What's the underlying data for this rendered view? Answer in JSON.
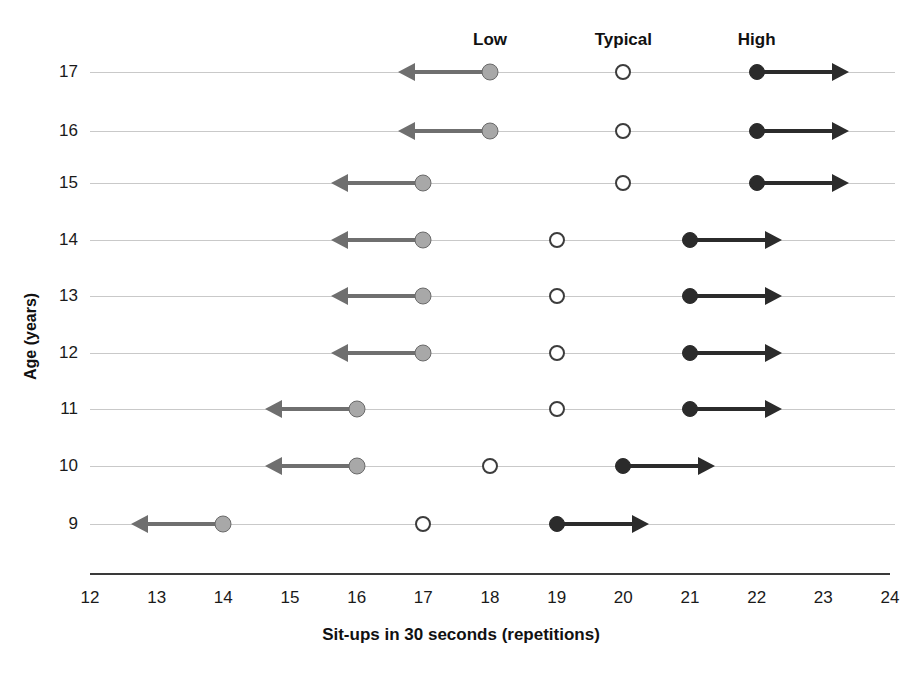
{
  "chart_data": {
    "type": "scatter",
    "title": "",
    "xlabel": "Sit-ups in 30 seconds (repetitions)",
    "ylabel": "Age (years)",
    "xlim": [
      12,
      24
    ],
    "ylim": [
      9,
      17
    ],
    "xticks": [
      "12",
      "13",
      "14",
      "15",
      "16",
      "17",
      "18",
      "19",
      "20",
      "21",
      "22",
      "23",
      "24"
    ],
    "yticks": [
      "9",
      "10",
      "11",
      "12",
      "13",
      "14",
      "15",
      "16",
      "17"
    ],
    "grid": true,
    "legend_position": "top",
    "band_labels": [
      {
        "text": "Low",
        "at_x": 18
      },
      {
        "text": "Typical",
        "at_x": 20
      },
      {
        "text": "High",
        "at_x": 22
      }
    ],
    "series": [
      {
        "name": "Low",
        "marker": "filled-gray-circle",
        "color": "#a8a8a8",
        "direction": "left"
      },
      {
        "name": "Typical",
        "marker": "open-circle",
        "color": "#ffffff",
        "direction": "none"
      },
      {
        "name": "High",
        "marker": "filled-black-circle",
        "color": "#2b2b2b",
        "direction": "right"
      }
    ],
    "categories": [
      9,
      10,
      11,
      12,
      13,
      14,
      15,
      16,
      17
    ],
    "rows": [
      {
        "age": 17,
        "low": 18,
        "typical": 20,
        "high": 22
      },
      {
        "age": 16,
        "low": 18,
        "typical": 20,
        "high": 22
      },
      {
        "age": 15,
        "low": 17,
        "typical": 20,
        "high": 22
      },
      {
        "age": 14,
        "low": 17,
        "typical": 19,
        "high": 21
      },
      {
        "age": 13,
        "low": 17,
        "typical": 19,
        "high": 21
      },
      {
        "age": 12,
        "low": 17,
        "typical": 19,
        "high": 21
      },
      {
        "age": 11,
        "low": 16,
        "typical": 19,
        "high": 21
      },
      {
        "age": 10,
        "low": 16,
        "typical": 18,
        "high": 20
      },
      {
        "age": 9,
        "low": 14,
        "typical": 17,
        "high": 19
      }
    ]
  },
  "geometry": {
    "plot_left": 90,
    "plot_right": 890,
    "x_min": 12,
    "x_max": 24,
    "row_y": {
      "17": 72,
      "16": 131,
      "15": 183,
      "14": 240,
      "13": 296,
      "12": 353,
      "11": 409,
      "10": 466,
      "9": 524
    },
    "axis_y": 573,
    "xtick_y": 588,
    "band_label_y": 30,
    "xlabel_y": 625,
    "ylabel_x": 22,
    "ylabel_y": 380,
    "arrow_span": 75
  }
}
